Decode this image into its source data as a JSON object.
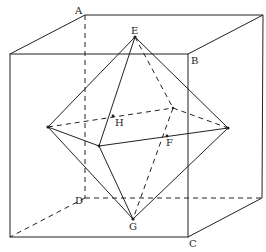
{
  "figure": {
    "labels": {
      "A": "A",
      "B": "B",
      "C": "C",
      "D": "D",
      "E": "E",
      "F": "F",
      "G": "G",
      "H": "H"
    },
    "cube": {
      "front_face": [
        [
          10,
          54
        ],
        [
          188,
          54
        ],
        [
          188,
          237
        ],
        [
          10,
          237
        ]
      ],
      "back_face": [
        [
          85,
          15
        ],
        [
          263,
          15
        ],
        [
          262,
          198
        ],
        [
          85,
          198
        ]
      ],
      "hidden_edges": [
        "A-D",
        "D-back_bottom_right",
        "D-front_bottom_left"
      ]
    },
    "octahedron": {
      "top_E": [
        135,
        37
      ],
      "bottom_G": [
        133,
        219
      ],
      "left": [
        48,
        127
      ],
      "right": [
        228,
        128
      ],
      "front": [
        99,
        146
      ],
      "back": [
        173,
        108
      ]
    },
    "marked_points": {
      "H": [
        117,
        116
      ],
      "F": [
        168,
        136
      ]
    }
  }
}
